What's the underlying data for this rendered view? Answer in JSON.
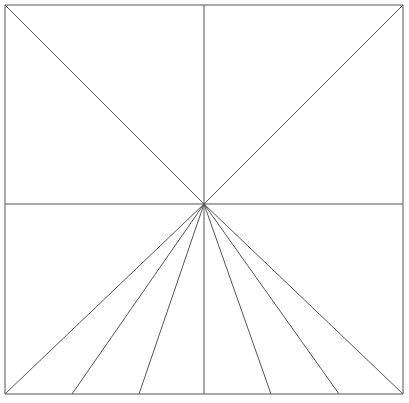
{
  "figure": {
    "canvas": {
      "width": 409,
      "height": 403
    },
    "background_color": "#ffffff",
    "stroke_color": "#555555",
    "stroke_width": 1,
    "center_point": {
      "x": 204,
      "y": 204
    },
    "frame": {
      "left": 5,
      "top": 5,
      "right": 403,
      "bottom": 394,
      "width": 398,
      "height": 389
    },
    "elements": [
      {
        "name": "frame-top-edge",
        "kind": "line",
        "x1": 5,
        "y1": 5,
        "x2": 403,
        "y2": 5
      },
      {
        "name": "frame-right-edge",
        "kind": "line",
        "x1": 403,
        "y1": 5,
        "x2": 403,
        "y2": 394
      },
      {
        "name": "frame-bottom-edge",
        "kind": "line",
        "x1": 403,
        "y1": 394,
        "x2": 5,
        "y2": 394
      },
      {
        "name": "frame-left-edge",
        "kind": "line",
        "x1": 5,
        "y1": 394,
        "x2": 5,
        "y2": 5
      },
      {
        "name": "vertical-center-axis",
        "kind": "line",
        "x1": 204,
        "y1": 5,
        "x2": 204,
        "y2": 394
      },
      {
        "name": "horizontal-center-axis",
        "kind": "line",
        "x1": 5,
        "y1": 204,
        "x2": 403,
        "y2": 204
      },
      {
        "name": "diagonal-center-to-top-left",
        "kind": "line",
        "x1": 204,
        "y1": 204,
        "x2": 5,
        "y2": 5
      },
      {
        "name": "diagonal-center-to-top-right",
        "kind": "line",
        "x1": 204,
        "y1": 204,
        "x2": 403,
        "y2": 5
      },
      {
        "name": "diagonal-center-to-bottom-left",
        "kind": "line",
        "x1": 204,
        "y1": 204,
        "x2": 5,
        "y2": 394
      },
      {
        "name": "diagonal-center-to-bottom-right",
        "kind": "line",
        "x1": 204,
        "y1": 204,
        "x2": 403,
        "y2": 394
      },
      {
        "name": "fan-line-bottom-1",
        "kind": "line",
        "x1": 204,
        "y1": 204,
        "x2": 72,
        "y2": 394
      },
      {
        "name": "fan-line-bottom-2",
        "kind": "line",
        "x1": 204,
        "y1": 204,
        "x2": 139,
        "y2": 394
      },
      {
        "name": "fan-line-bottom-3",
        "kind": "line",
        "x1": 204,
        "y1": 204,
        "x2": 271,
        "y2": 394
      },
      {
        "name": "fan-line-bottom-4",
        "kind": "line",
        "x1": 204,
        "y1": 204,
        "x2": 339,
        "y2": 394
      }
    ],
    "bottom_edge_intersections": [
      5,
      72,
      139,
      204,
      271,
      339,
      403
    ],
    "line_count": 14
  }
}
